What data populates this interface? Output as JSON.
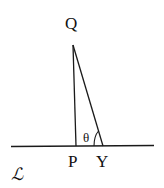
{
  "diagram": {
    "labels": {
      "top_point": "Q",
      "foot_point": "P",
      "other_point": "Y",
      "angle": "θ",
      "line": "ℒ"
    },
    "colors": {
      "stroke": "#1a1a1a",
      "background": "#ffffff"
    }
  }
}
